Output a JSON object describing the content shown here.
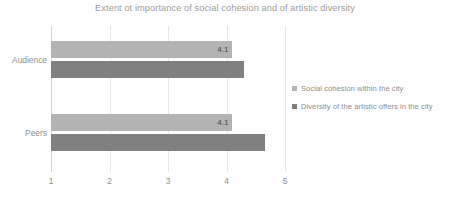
{
  "chart_data": {
    "type": "bar",
    "orientation": "horizontal",
    "title": "Extent ot importance of social cohesion and of artistic diversity",
    "categories": [
      "Audience",
      "Peers"
    ],
    "series": [
      {
        "name": "Social cohesion within the city",
        "color": "#b3b3b3",
        "values": [
          4.1,
          4.1
        ],
        "labels": [
          "4.1",
          "4.1"
        ]
      },
      {
        "name": "Diversity of the artistic offers in the city",
        "color": "#808080",
        "values": [
          4.3,
          4.66
        ],
        "labels": [
          "",
          ""
        ]
      }
    ],
    "xlabel": "",
    "ylabel": "",
    "xlim": [
      1,
      5
    ],
    "xticks": [
      1,
      2,
      3,
      4,
      5
    ],
    "xtick_labels": [
      "1",
      "2",
      "3",
      "4",
      "5"
    ],
    "grid": true,
    "legend_position": "right"
  }
}
